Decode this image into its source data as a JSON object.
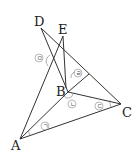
{
  "diagram": {
    "points": {
      "A": {
        "label": "A",
        "x": 20,
        "y": 139
      },
      "B": {
        "label": "B",
        "x": 68,
        "y": 92
      },
      "C": {
        "label": "C",
        "x": 121,
        "y": 104
      },
      "D": {
        "label": "D",
        "x": 41,
        "y": 28
      },
      "E": {
        "label": "E",
        "x": 63,
        "y": 36
      }
    },
    "segments": [
      "AC",
      "AE",
      "AB",
      "BC",
      "DB",
      "DC",
      "EB",
      "B-DC"
    ],
    "angle_labels": {
      "a1": "ㄱ",
      "a2": "ㄴ",
      "a3": "ㄷ",
      "a4": "ㄹ",
      "a5": "ㅁ"
    }
  }
}
